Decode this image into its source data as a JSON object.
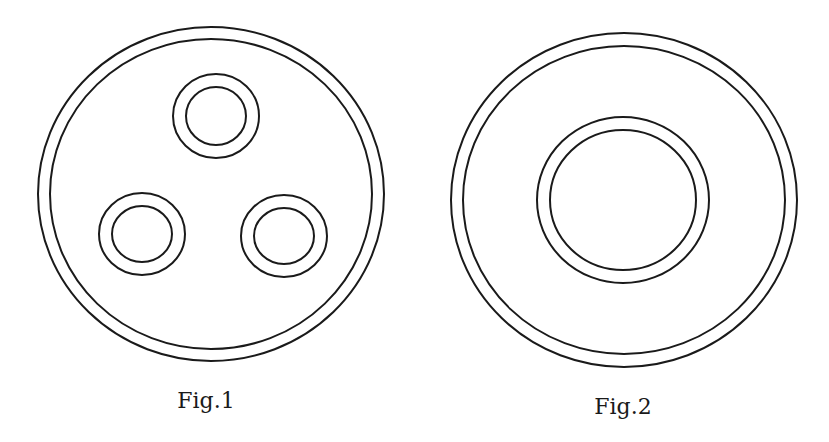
{
  "figures": [
    {
      "caption": "Fig.1",
      "caption_pos": {
        "x": 206,
        "y": 408
      },
      "circles": [
        {
          "name": "outer-ring-outer",
          "cx": 211,
          "cy": 194,
          "rx": 173,
          "ry": 167
        },
        {
          "name": "outer-ring-inner",
          "cx": 211,
          "cy": 194,
          "rx": 161,
          "ry": 155
        },
        {
          "name": "top-ring-outer",
          "cx": 216,
          "cy": 116,
          "rx": 43,
          "ry": 42
        },
        {
          "name": "top-ring-inner",
          "cx": 216,
          "cy": 116,
          "rx": 30,
          "ry": 29
        },
        {
          "name": "left-ring-outer",
          "cx": 142,
          "cy": 234,
          "rx": 43,
          "ry": 41
        },
        {
          "name": "left-ring-inner",
          "cx": 142,
          "cy": 234,
          "rx": 30,
          "ry": 28
        },
        {
          "name": "right-ring-outer",
          "cx": 284,
          "cy": 236,
          "rx": 43,
          "ry": 41
        },
        {
          "name": "right-ring-inner",
          "cx": 284,
          "cy": 236,
          "rx": 30,
          "ry": 28
        }
      ]
    },
    {
      "caption": "Fig.2",
      "caption_pos": {
        "x": 623,
        "y": 414
      },
      "circles": [
        {
          "name": "outer-ring-outer",
          "cx": 624,
          "cy": 200,
          "rx": 173,
          "ry": 167
        },
        {
          "name": "outer-ring-inner",
          "cx": 624,
          "cy": 200,
          "rx": 161,
          "ry": 154
        },
        {
          "name": "center-ring-outer",
          "cx": 623,
          "cy": 200,
          "rx": 86,
          "ry": 83
        },
        {
          "name": "center-ring-inner",
          "cx": 623,
          "cy": 200,
          "rx": 73,
          "ry": 70
        }
      ]
    }
  ],
  "style": {
    "stroke": "#1a1a1a",
    "background": "#ffffff"
  }
}
